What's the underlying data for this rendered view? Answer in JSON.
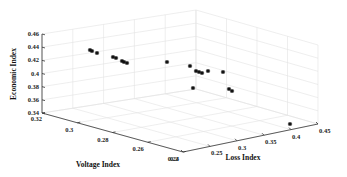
{
  "chart_data": {
    "type": "scatter3d",
    "title": "",
    "xlabel": "Loss Index",
    "ylabel": "Voltage Index",
    "zlabel": "Economic Index",
    "xlim": [
      0.2,
      0.45
    ],
    "ylim": [
      0.24,
      0.32
    ],
    "zlim": [
      0.34,
      0.46
    ],
    "x_ticks": [
      "0.2",
      "0.25",
      "0.3",
      "0.35",
      "0.4",
      "0.45"
    ],
    "y_ticks": [
      "0.32",
      "0.3",
      "0.28",
      "0.26",
      "0.24"
    ],
    "z_ticks": [
      "0.46",
      "0.44",
      "0.42",
      "0.4",
      "0.38",
      "0.36",
      "0.34"
    ],
    "grid": true,
    "marker": "*",
    "marker_color": "#111111",
    "points_screen_px": [
      [
        90,
        50
      ],
      [
        92,
        51
      ],
      [
        97,
        53
      ],
      [
        113,
        57
      ],
      [
        116,
        58
      ],
      [
        122,
        61
      ],
      [
        124,
        62
      ],
      [
        127,
        63
      ],
      [
        167,
        62
      ],
      [
        190,
        66
      ],
      [
        196,
        71
      ],
      [
        199,
        72
      ],
      [
        202,
        73
      ],
      [
        208,
        71
      ],
      [
        223,
        72
      ],
      [
        193,
        88
      ],
      [
        229,
        89
      ],
      [
        232,
        91
      ],
      [
        290,
        124
      ]
    ]
  },
  "labels": {
    "zlabel": "Economic Index",
    "ylabel": "Voltage Index",
    "xlabel": "Loss Index"
  }
}
